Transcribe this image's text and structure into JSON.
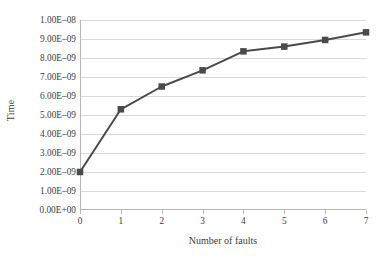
{
  "chart_data": {
    "type": "line",
    "title": "",
    "xlabel": "Number of faults",
    "ylabel": "Time",
    "x": [
      0,
      1,
      2,
      3,
      4,
      5,
      6,
      7
    ],
    "values": [
      2e-09,
      5.3e-09,
      6.5e-09,
      7.35e-09,
      8.35e-09,
      8.6e-09,
      8.95e-09,
      9.35e-09
    ],
    "series": [
      {
        "name": "Time",
        "values": [
          2e-09,
          5.3e-09,
          6.5e-09,
          7.35e-09,
          8.35e-09,
          8.6e-09,
          8.95e-09,
          9.35e-09
        ]
      }
    ],
    "xlim": [
      0,
      7
    ],
    "ylim": [
      0,
      1e-08
    ],
    "x_tick_labels": [
      "0",
      "1",
      "2",
      "3",
      "4",
      "5",
      "6",
      "7"
    ],
    "y_tick_values": [
      0,
      1e-09,
      2e-09,
      3e-09,
      4e-09,
      5e-09,
      6e-09,
      7e-09,
      8e-09,
      9e-09,
      1e-08
    ],
    "y_tick_labels": [
      "0.00E+00",
      "1.00E–09",
      "2.00E–09",
      "3.00E–09",
      "4.00E–09",
      "5.00E–09",
      "6.00E–09",
      "7.00E–09",
      "8.00E–09",
      "9.00E–09",
      "1.00E–08"
    ],
    "grid": "horizontal",
    "legend": "none",
    "marker": "square",
    "line_color": "#4a4a4a",
    "marker_color": "#4a4a4a",
    "grid_color": "#d9d9d9",
    "axis_color": "#b8b8b8"
  }
}
